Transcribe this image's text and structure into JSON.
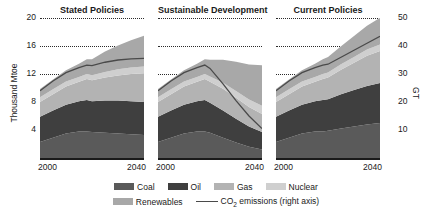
{
  "chart_data": {
    "type": "area",
    "title": "",
    "subtitle": "",
    "ylabel": "Thousand Mtoe",
    "ylabel_right": "GT",
    "xlabel": "",
    "ylim": [
      0,
      20
    ],
    "ylim_right": [
      0,
      50
    ],
    "xlim": [
      2000,
      2040
    ],
    "grid": true,
    "legend_position": "bottom",
    "yticks": [
      4,
      8,
      12,
      16,
      20
    ],
    "yticks_right": [
      10,
      20,
      30,
      40,
      50
    ],
    "xticks": [
      2000,
      2040
    ],
    "xtick_labels": [
      "2000",
      "2040"
    ],
    "x": [
      2000,
      2005,
      2010,
      2015,
      2018,
      2020,
      2025,
      2030,
      2035,
      2040
    ],
    "series_order": [
      "Coal",
      "Oil",
      "Gas",
      "Nuclear",
      "Renewables"
    ],
    "colors": {
      "Coal": "#5a5a5a",
      "Oil": "#3f3f3f",
      "Gas": "#b3b3b3",
      "Nuclear": "#cfcfcf",
      "Renewables": "#a8a8a8",
      "CO2_line": "#4a4a4a",
      "axis": "#1a1a1a",
      "grid": "#2b2b2b"
    },
    "panels": [
      {
        "name": "Stated Policies",
        "series": [
          {
            "name": "Coal",
            "values": [
              2.3,
              2.9,
              3.5,
              3.8,
              3.8,
              3.7,
              3.6,
              3.5,
              3.4,
              3.3
            ]
          },
          {
            "name": "Oil",
            "values": [
              3.6,
              3.9,
              4.1,
              4.3,
              4.5,
              4.4,
              4.6,
              4.7,
              4.7,
              4.7
            ]
          },
          {
            "name": "Gas",
            "values": [
              2.1,
              2.3,
              2.6,
              2.8,
              3.0,
              3.0,
              3.3,
              3.6,
              3.9,
              4.1
            ]
          },
          {
            "name": "Nuclear",
            "values": [
              0.67,
              0.72,
              0.72,
              0.67,
              0.71,
              0.72,
              0.8,
              0.87,
              0.93,
              0.98
            ]
          },
          {
            "name": "Renewables",
            "values": [
              1.2,
              1.4,
              1.6,
              1.9,
              2.1,
              2.3,
              2.9,
              3.4,
              3.9,
              4.4
            ]
          }
        ],
        "co2_emissions": [
          24.0,
          27.5,
          30.5,
          32.3,
          33.2,
          33.0,
          34.2,
          35.0,
          35.4,
          35.6
        ]
      },
      {
        "name": "Sustainable Development",
        "series": [
          {
            "name": "Coal",
            "values": [
              2.3,
              2.9,
              3.5,
              3.8,
              3.8,
              3.6,
              2.9,
              2.2,
              1.6,
              1.2
            ]
          },
          {
            "name": "Oil",
            "values": [
              3.6,
              3.9,
              4.1,
              4.3,
              4.5,
              4.3,
              3.9,
              3.4,
              2.9,
              2.5
            ]
          },
          {
            "name": "Gas",
            "values": [
              2.1,
              2.3,
              2.6,
              2.8,
              3.0,
              3.0,
              3.1,
              3.0,
              2.8,
              2.6
            ]
          },
          {
            "name": "Nuclear",
            "values": [
              0.67,
              0.72,
              0.72,
              0.67,
              0.71,
              0.74,
              0.85,
              0.96,
              1.06,
              1.15
            ]
          },
          {
            "name": "Renewables",
            "values": [
              1.2,
              1.4,
              1.6,
              1.9,
              2.1,
              2.4,
              3.3,
              4.2,
              5.0,
              5.8
            ]
          }
        ],
        "co2_emissions": [
          24.0,
          27.5,
          30.5,
          32.3,
          33.2,
          32.0,
          26.5,
          20.5,
          15.0,
          10.5
        ]
      },
      {
        "name": "Current Policies",
        "series": [
          {
            "name": "Coal",
            "values": [
              2.3,
              2.9,
              3.5,
              3.8,
              3.8,
              3.9,
              4.2,
              4.5,
              4.8,
              5.0
            ]
          },
          {
            "name": "Oil",
            "values": [
              3.6,
              3.9,
              4.1,
              4.3,
              4.5,
              4.5,
              4.9,
              5.2,
              5.5,
              5.7
            ]
          },
          {
            "name": "Gas",
            "values": [
              2.1,
              2.3,
              2.6,
              2.8,
              3.0,
              3.1,
              3.5,
              3.9,
              4.3,
              4.6
            ]
          },
          {
            "name": "Nuclear",
            "values": [
              0.67,
              0.72,
              0.72,
              0.67,
              0.71,
              0.72,
              0.78,
              0.84,
              0.89,
              0.93
            ]
          },
          {
            "name": "Renewables",
            "values": [
              1.2,
              1.4,
              1.6,
              1.9,
              2.1,
              2.2,
              2.6,
              3.0,
              3.4,
              3.8
            ]
          }
        ],
        "co2_emissions": [
          24.0,
          27.5,
          30.5,
          32.3,
          33.2,
          33.5,
          36.0,
          38.5,
          41.0,
          43.5
        ]
      }
    ],
    "legend": [
      {
        "label": "Coal",
        "color": "#5a5a5a",
        "type": "area"
      },
      {
        "label": "Oil",
        "color": "#3f3f3f",
        "type": "area"
      },
      {
        "label": "Gas",
        "color": "#b3b3b3",
        "type": "area"
      },
      {
        "label": "Nuclear",
        "color": "#cfcfcf",
        "type": "area"
      },
      {
        "label": "Renewables",
        "color": "#a8a8a8",
        "type": "area"
      },
      {
        "label": "CO2 emissions (right axis)",
        "color": "#4a4a4a",
        "type": "line"
      }
    ]
  }
}
